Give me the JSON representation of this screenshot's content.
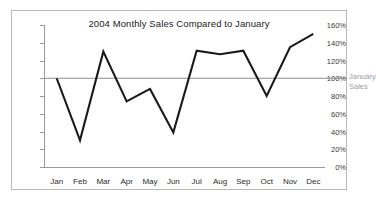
{
  "chart_data": {
    "type": "line",
    "title": "2004 Monthly Sales Compared to January",
    "xlabel": "",
    "ylabel": "",
    "categories": [
      "Jan",
      "Feb",
      "Mar",
      "Apr",
      "May",
      "Jun",
      "Jul",
      "Aug",
      "Sep",
      "Oct",
      "Nov",
      "Dec"
    ],
    "series": [
      {
        "name": "Monthly Sales",
        "values": [
          100,
          30,
          130,
          74,
          88,
          39,
          131,
          127,
          131,
          80,
          135,
          150
        ],
        "color": "#1a1a1a"
      }
    ],
    "ylim": [
      0,
      160
    ],
    "ytick_values": [
      0,
      20,
      40,
      60,
      80,
      100,
      120,
      140,
      160
    ],
    "ytick_labels": [
      "0%",
      "20%",
      "40%",
      "60%",
      "80%",
      "100%",
      "120%",
      "140%",
      "160%"
    ],
    "grid": false,
    "legend": "none",
    "reference_line": {
      "value": 100,
      "label_line1": "January",
      "label_line2": "Sales",
      "color": "#8c8c8c"
    }
  },
  "frame": {
    "border_color": "#b9b9b9",
    "background": "#ffffff"
  }
}
